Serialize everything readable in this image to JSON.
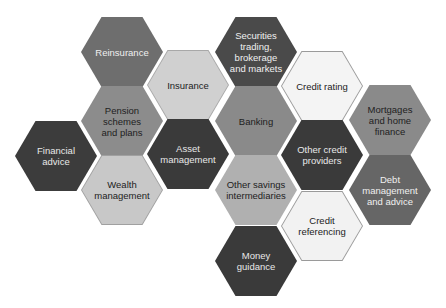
{
  "diagram": {
    "hexagons": [
      {
        "id": "reinsurance",
        "label": "Reinsurance",
        "cx": 122,
        "cy": 52,
        "fill": "#6e6e6e",
        "border": "#6e6e6e",
        "text": "#f0f0f0"
      },
      {
        "id": "securities",
        "label": "Securities\ntrading,\nbrokerage\nand markets",
        "cx": 256,
        "cy": 52,
        "fill": "#4a4a4a",
        "border": "#4a4a4a",
        "text": "#f0f0f0"
      },
      {
        "id": "insurance",
        "label": "Insurance",
        "cx": 188,
        "cy": 85,
        "fill": "#d0d0d0",
        "border": "#a8a8a8",
        "text": "#222222"
      },
      {
        "id": "credit-rating",
        "label": "Credit rating",
        "cx": 322,
        "cy": 86,
        "fill": "#f4f4f4",
        "border": "#9a9a9a",
        "text": "#222222"
      },
      {
        "id": "pension",
        "label": "Pension\nschemes\nand plans",
        "cx": 122,
        "cy": 121,
        "fill": "#8c8c8c",
        "border": "#8c8c8c",
        "text": "#1e1e1e"
      },
      {
        "id": "banking",
        "label": "Banking",
        "cx": 256,
        "cy": 121,
        "fill": "#8a8a8a",
        "border": "#8a8a8a",
        "text": "#1e1e1e"
      },
      {
        "id": "mortgages",
        "label": "Mortgages\nand home\nfinance",
        "cx": 390,
        "cy": 120,
        "fill": "#8a8a8a",
        "border": "#8a8a8a",
        "text": "#1e1e1e"
      },
      {
        "id": "financial-advice",
        "label": "Financial\nadvice",
        "cx": 56,
        "cy": 156,
        "fill": "#3c3c3c",
        "border": "#3c3c3c",
        "text": "#e8e8e8"
      },
      {
        "id": "asset-management",
        "label": "Asset\nmanagement",
        "cx": 188,
        "cy": 154,
        "fill": "#3a3a3a",
        "border": "#3a3a3a",
        "text": "#e8e8e8"
      },
      {
        "id": "other-credit",
        "label": "Other credit\nproviders",
        "cx": 322,
        "cy": 155,
        "fill": "#3a3a3a",
        "border": "#3a3a3a",
        "text": "#e8e8e8"
      },
      {
        "id": "wealth",
        "label": "Wealth\nmanagement",
        "cx": 122,
        "cy": 190,
        "fill": "#c8c8c8",
        "border": "#a0a0a0",
        "text": "#222222"
      },
      {
        "id": "other-savings",
        "label": "Other savings\nintermediaries",
        "cx": 256,
        "cy": 190,
        "fill": "#b0b0b0",
        "border": "#b0b0b0",
        "text": "#222222"
      },
      {
        "id": "debt",
        "label": "Debt\nmanagement\nand advice",
        "cx": 390,
        "cy": 190,
        "fill": "#666666",
        "border": "#666666",
        "text": "#f0f0f0"
      },
      {
        "id": "credit-referencing",
        "label": "Credit\nreferencing",
        "cx": 322,
        "cy": 226,
        "fill": "#f2f2f2",
        "border": "#9a9a9a",
        "text": "#222222"
      },
      {
        "id": "money-guidance",
        "label": "Money\nguidance",
        "cx": 256,
        "cy": 261,
        "fill": "#3a3a3a",
        "border": "#3a3a3a",
        "text": "#e8e8e8"
      }
    ]
  }
}
